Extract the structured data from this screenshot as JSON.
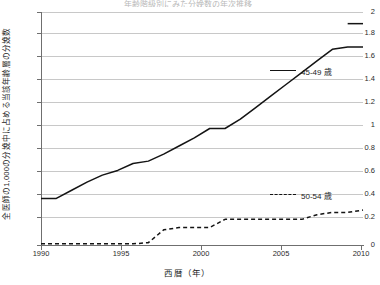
{
  "title_strip": "年齢階級別にみた分娩数の年次推移",
  "axis": {
    "x_title": "西暦（年）",
    "y_title": "全医師の1,000の分娩中に占める当該年齢層の分娩数",
    "x_ticks": [
      "1990",
      "1995",
      "2000",
      "2005",
      "2010"
    ],
    "y_ticks": [
      "2",
      "1.8",
      "1.6",
      "1.4",
      "1.2",
      "1",
      "0.8",
      "0.6",
      "0.4",
      "0.2",
      "0"
    ]
  },
  "legend": {
    "items": [
      {
        "label": "45-49 歳",
        "style": "solid",
        "color": "#141414"
      },
      {
        "label": "50-54 歳",
        "style": "dashed",
        "color": "#141414"
      }
    ]
  },
  "colors": {
    "grid": "#c8c8c8",
    "axis": "#6f6f6f",
    "series": "#141414",
    "text": "#1d1d1d",
    "background": "#ffffff"
  },
  "chart_data": {
    "type": "line",
    "title": "年齢階級別にみた分娩数の年次推移",
    "xlabel": "西暦（年）",
    "ylabel": "全医師の1,000の分娩中に占める当該年齢層の分娩数",
    "xlim": [
      1990,
      2011
    ],
    "ylim": [
      0,
      2
    ],
    "ytick_step": 0.2,
    "grid": true,
    "legend_position": "inside-right",
    "x": [
      1990,
      1991,
      1992,
      1993,
      1994,
      1995,
      1996,
      1997,
      1998,
      1999,
      2000,
      2001,
      2002,
      2003,
      2004,
      2005,
      2006,
      2007,
      2008,
      2009,
      2010,
      2011
    ],
    "series": [
      {
        "name": "45-49 歳",
        "style": "solid",
        "values": [
          0.4,
          0.4,
          0.47,
          0.54,
          0.6,
          0.64,
          0.7,
          0.72,
          0.78,
          0.85,
          0.92,
          1.0,
          1.0,
          1.08,
          1.18,
          1.28,
          1.38,
          1.48,
          1.58,
          1.68,
          1.7,
          1.7
        ]
      },
      {
        "name": "50-54 歳",
        "style": "dashed",
        "values": [
          0.01,
          0.01,
          0.01,
          0.01,
          0.01,
          0.01,
          0.01,
          0.02,
          0.13,
          0.15,
          0.15,
          0.15,
          0.22,
          0.22,
          0.22,
          0.22,
          0.22,
          0.22,
          0.26,
          0.28,
          0.28,
          0.3
        ]
      }
    ],
    "series_tail": [
      {
        "name": "45-49 歳",
        "x": [
          2010,
          2011
        ],
        "values": [
          1.9,
          1.9
        ]
      }
    ]
  }
}
